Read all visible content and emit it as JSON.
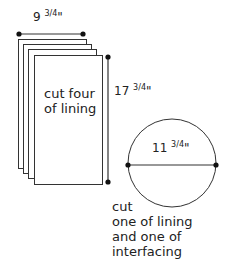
{
  "diagram": {
    "rectangle_group": {
      "width_label": {
        "whole": "9",
        "frac": "3/4",
        "unit": "\""
      },
      "height_label": {
        "whole": "17",
        "frac": "3/4",
        "unit": "\""
      },
      "instruction_lines": [
        "cut four",
        "of lining"
      ],
      "count": 4
    },
    "circle": {
      "diameter_label": {
        "whole": "11",
        "frac": "3/4",
        "unit": "\""
      },
      "instruction_lines": [
        "cut",
        "one of lining",
        "and one of",
        "interfacing"
      ]
    },
    "colors": {
      "line": "#333333",
      "dot": "#111111",
      "text": "#222222"
    }
  }
}
